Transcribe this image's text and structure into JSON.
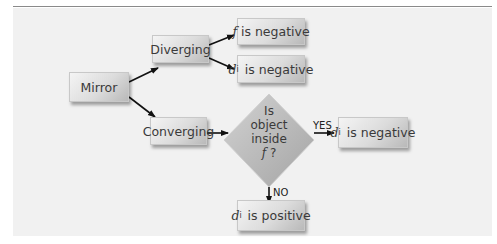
{
  "diagram": {
    "title": "",
    "nodes": {
      "mirror": {
        "label": "Mirror"
      },
      "diverging": {
        "label": "Diverging"
      },
      "converging": {
        "label": "Converging"
      },
      "f_negative": {
        "var": "f",
        "sub": "",
        "rest": " is negative"
      },
      "di_negative_1": {
        "var": "d",
        "sub": "i",
        "rest": " is negative"
      },
      "decision": {
        "line1": "Is",
        "line2": "object",
        "line3": "inside",
        "line4_var": "f",
        "line4_rest": " ?"
      },
      "di_negative_2": {
        "var": "d",
        "sub": "i",
        "rest": " is negative"
      },
      "di_positive": {
        "var": "d",
        "sub": "i",
        "rest": " is positive"
      }
    },
    "edge_labels": {
      "yes": "YES",
      "no": "NO"
    },
    "edges": [
      {
        "from": "mirror",
        "to": "diverging"
      },
      {
        "from": "mirror",
        "to": "converging"
      },
      {
        "from": "diverging",
        "to": "f_negative"
      },
      {
        "from": "diverging",
        "to": "di_negative_1"
      },
      {
        "from": "converging",
        "to": "decision"
      },
      {
        "from": "decision",
        "to": "di_negative_2",
        "label": "YES"
      },
      {
        "from": "decision",
        "to": "di_positive",
        "label": "NO"
      }
    ],
    "colors": {
      "box_light": "#f4f4f4",
      "box_dark": "#b9b9b9",
      "diamond": "#b4b4b4",
      "panel": "#f1f1f1",
      "text": "#3a3a3a"
    }
  }
}
